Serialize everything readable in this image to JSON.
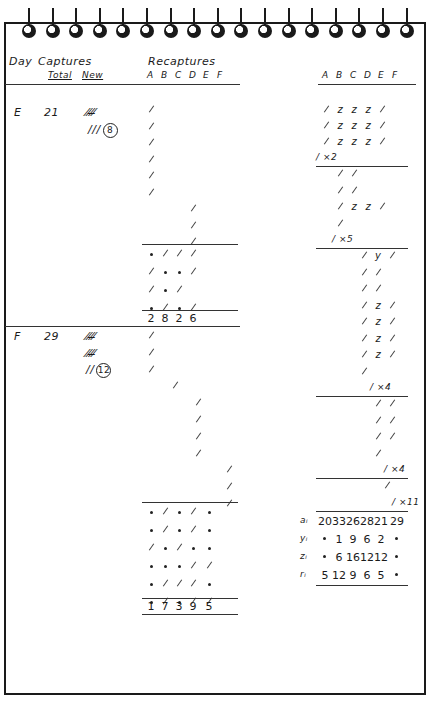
{
  "notebook": {
    "ring_count": 17,
    "headers": {
      "day": "Day",
      "captures": "Captures",
      "total": "Total",
      "new": "New",
      "recaptures": "Recaptures",
      "left_cols": [
        "A",
        "B",
        "C",
        "D",
        "E",
        "F"
      ],
      "right_cols": [
        "A",
        "B",
        "C",
        "D",
        "E",
        "F"
      ]
    },
    "days": [
      {
        "day": "E",
        "total": "21",
        "new_tally": [
          "𝍸",
          "///"
        ],
        "new_count": "8"
      },
      {
        "day": "F",
        "total": "29",
        "new_tally": [
          "𝍸",
          "𝍸",
          "//"
        ],
        "new_count": "12"
      }
    ],
    "left_table": {
      "day_E_rows": [
        [
          "/",
          "",
          "",
          "",
          "",
          ""
        ],
        [
          "/",
          "",
          "",
          "",
          "",
          ""
        ],
        [
          "/",
          "",
          "",
          "",
          "",
          ""
        ],
        [
          "/",
          "",
          "",
          "",
          "",
          ""
        ],
        [
          "/",
          "",
          "",
          "",
          "",
          ""
        ],
        [
          "/",
          "",
          "",
          "",
          "",
          ""
        ],
        [
          "",
          "",
          "",
          "/",
          "",
          ""
        ],
        [
          "",
          "",
          "",
          "/",
          "",
          ""
        ],
        [
          "",
          "",
          "",
          "/",
          "",
          ""
        ]
      ],
      "day_E_summary": [
        [
          "•",
          "/",
          "/",
          "/"
        ],
        [
          "/",
          "•",
          "•",
          "/"
        ],
        [
          "/",
          "•",
          "/",
          ""
        ],
        [
          "•",
          "/",
          "•",
          "/"
        ]
      ],
      "day_E_totals": [
        "2",
        "8",
        "2",
        "6"
      ],
      "day_F_rows": [
        [
          "/",
          "",
          "",
          "",
          "",
          ""
        ],
        [
          "/",
          "",
          "",
          "",
          "",
          ""
        ],
        [
          "/",
          "",
          "",
          "",
          "",
          ""
        ],
        [
          "",
          "/",
          "",
          "",
          "",
          ""
        ],
        [
          "",
          "",
          "",
          "/",
          "",
          ""
        ],
        [
          "",
          "",
          "",
          "/",
          "",
          ""
        ],
        [
          "",
          "",
          "",
          "/",
          "",
          ""
        ],
        [
          "",
          "",
          "",
          "/",
          "",
          ""
        ],
        [
          "",
          "",
          "",
          "",
          "/",
          ""
        ],
        [
          "",
          "",
          "",
          "",
          "/",
          ""
        ],
        [
          "",
          "",
          "",
          "",
          "/",
          ""
        ]
      ],
      "day_F_summary": [
        [
          "•",
          "/",
          "•",
          "/",
          "•"
        ],
        [
          "•",
          "/",
          "•",
          "/",
          "•"
        ],
        [
          "/",
          "•",
          "/",
          "•",
          "•"
        ],
        [
          "•",
          "•",
          "•",
          "/",
          "/"
        ],
        [
          "•",
          "/",
          "/",
          "/",
          "•"
        ],
        [
          "•",
          "/",
          "•",
          "/",
          "/"
        ]
      ],
      "day_F_totals": [
        "1",
        "7",
        "3",
        "9",
        "5"
      ]
    },
    "right_table": {
      "block1": [
        [
          "/",
          "z",
          "z",
          "z",
          "/",
          ""
        ],
        [
          "/",
          "z",
          "z",
          "z",
          "/",
          ""
        ],
        [
          "/",
          "z",
          "z",
          "z",
          "/",
          ""
        ]
      ],
      "block1_mult": "/ ×2",
      "block2": [
        [
          "",
          "/",
          "/",
          "",
          "",
          ""
        ],
        [
          "",
          "/",
          "/",
          "",
          "",
          ""
        ],
        [
          "",
          "/",
          "z",
          "z",
          "/",
          ""
        ],
        [
          "",
          "/",
          "",
          "",
          "",
          ""
        ]
      ],
      "block2_mult": "/ ×5",
      "block3": [
        [
          "",
          "",
          "/",
          "y",
          "/",
          ""
        ],
        [
          "",
          "",
          "/",
          "/",
          "",
          ""
        ],
        [
          "",
          "",
          "/",
          "/",
          "",
          ""
        ],
        [
          "",
          "",
          "/",
          "z",
          "/",
          ""
        ],
        [
          "",
          "",
          "/",
          "z",
          "/",
          ""
        ],
        [
          "",
          "",
          "/",
          "z",
          "/",
          ""
        ],
        [
          "",
          "",
          "/",
          "z",
          "/",
          ""
        ],
        [
          "",
          "",
          "/",
          "",
          "",
          ""
        ]
      ],
      "block3_mult": "/ ×4",
      "block4": [
        [
          "",
          "",
          "",
          "/",
          "/",
          ""
        ],
        [
          "",
          "",
          "",
          "/",
          "/",
          ""
        ],
        [
          "",
          "",
          "",
          "/",
          "/",
          ""
        ],
        [
          "",
          "",
          "",
          "/",
          "",
          ""
        ]
      ],
      "block4_mult": "/ ×4",
      "block5": [
        [
          "",
          "",
          "",
          "",
          "/",
          ""
        ]
      ],
      "block5_mult": "/ ×11"
    },
    "summary_table": {
      "rows": [
        {
          "label": "aᵢ",
          "values": [
            "20",
            "33",
            "26",
            "28",
            "21",
            "29"
          ]
        },
        {
          "label": "yᵢ",
          "values": [
            "•",
            "1",
            "9",
            "6",
            "2",
            "•"
          ]
        },
        {
          "label": "zᵢ",
          "values": [
            "•",
            "6",
            "16",
            "12",
            "12",
            "•"
          ]
        },
        {
          "label": "rᵢ",
          "values": [
            "5",
            "12",
            "9",
            "6",
            "5",
            "•"
          ]
        }
      ]
    }
  }
}
